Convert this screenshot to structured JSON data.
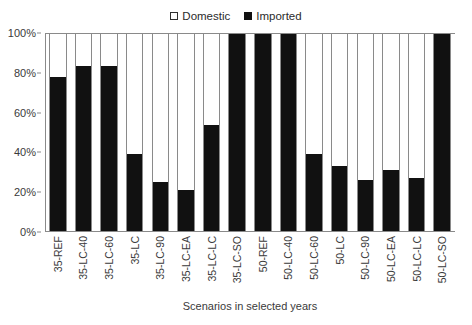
{
  "chart_data": {
    "type": "bar",
    "subtype": "stacked-percent-column",
    "title": "",
    "xlabel": "Scenarios in selected years",
    "ylabel": "",
    "ylim": [
      0,
      100
    ],
    "y_tick_labels": [
      "0%",
      "20%",
      "40%",
      "60%",
      "80%",
      "100%"
    ],
    "y_ticks": [
      0,
      20,
      40,
      60,
      80,
      100
    ],
    "grid": false,
    "legend_position": "top-center",
    "categories": [
      "35-REF",
      "35-LC-40",
      "35-LC-60",
      "35-LC",
      "35-LC-90",
      "35-LC-EA",
      "35-LC-LC",
      "35-LC-SO",
      "50-REF",
      "50-LC-40",
      "50-LC-60",
      "50-LC",
      "50-LC-90",
      "50-LC-EA",
      "50-LC-LC",
      "50-LC-SO"
    ],
    "series": [
      {
        "name": "Imported",
        "color": "#111111",
        "values": [
          78,
          84,
          84,
          39,
          25,
          21,
          54,
          100,
          100,
          100,
          39,
          33,
          26,
          31,
          27,
          100
        ]
      },
      {
        "name": "Domestic",
        "color": "#ffffff",
        "values": [
          22,
          16,
          16,
          61,
          75,
          79,
          46,
          0,
          0,
          0,
          61,
          67,
          74,
          69,
          73,
          0
        ]
      }
    ]
  },
  "legend": {
    "items": [
      {
        "label": "Domestic",
        "swatch": "open-square-icon"
      },
      {
        "label": "Imported",
        "swatch": "filled-square-icon"
      }
    ]
  },
  "axes": {
    "x_title": "Scenarios in selected years"
  }
}
